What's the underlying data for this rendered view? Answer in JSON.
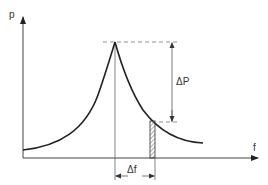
{
  "diagram": {
    "type": "resonance-curve",
    "y_axis_label": "p",
    "x_axis_label": "f",
    "delta_p_label": "ΔP",
    "delta_f_label": "Δf",
    "colors": {
      "line": "#222222",
      "axis": "#444444",
      "dashed": "#777777"
    }
  }
}
